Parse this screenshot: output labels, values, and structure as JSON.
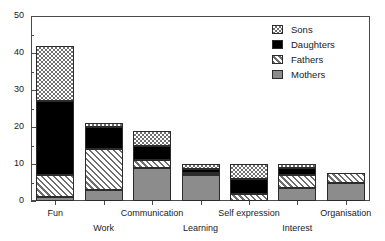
{
  "chart_data": {
    "type": "bar",
    "stacked": true,
    "title": "",
    "subtitle": "",
    "xlabel": "",
    "ylabel": "",
    "ylim": [
      0,
      50
    ],
    "y_ticks_major": [
      0,
      10,
      20,
      30,
      40,
      50
    ],
    "y_ticks_minor": [
      5,
      15,
      25,
      35,
      45
    ],
    "y_tick_labels": [
      "0",
      "10",
      "20",
      "30",
      "40",
      "50"
    ],
    "grid": false,
    "legend_position": "top-right",
    "categories": [
      "Fun",
      "Work",
      "Communication",
      "Learning",
      "Self expression",
      "Interest",
      "Organisation"
    ],
    "category_label_rows": [
      0,
      1,
      0,
      1,
      0,
      1,
      0
    ],
    "series": [
      {
        "name": "Mothers",
        "pattern": "solid-gray",
        "color": "#8c8c8c",
        "values": [
          1,
          3,
          9,
          7,
          0,
          3.5,
          5
        ]
      },
      {
        "name": "Fathers",
        "pattern": "diagonal-hatch",
        "color": "#6e6e6e",
        "values": [
          6,
          11,
          2,
          0.6,
          2,
          3.5,
          2.5
        ]
      },
      {
        "name": "Daughters",
        "pattern": "solid-black",
        "color": "#000000",
        "values": [
          20,
          6,
          4,
          1,
          4,
          2,
          0
        ]
      },
      {
        "name": "Sons",
        "pattern": "checkerboard",
        "color": "#6f6f6f",
        "values": [
          15,
          1,
          4,
          1.4,
          4,
          1,
          0
        ]
      }
    ],
    "totals": [
      42,
      21,
      19,
      10,
      10,
      10,
      7.5
    ],
    "legend_entries": [
      "Sons",
      "Daughters",
      "Fathers",
      "Mothers"
    ]
  }
}
